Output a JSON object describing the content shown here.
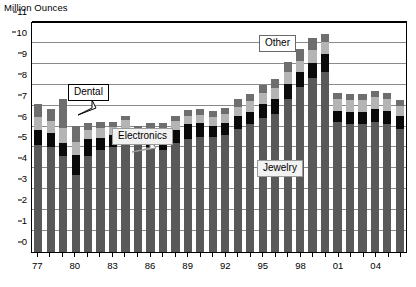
{
  "axis_title": "Million Ounces",
  "labels": {
    "jewelry": "Jewelry",
    "electronics": "Electronics",
    "dental": "Dental",
    "other": "Other"
  },
  "colors": {
    "jewelry": "#595959",
    "electronics": "#0a0a0a",
    "dental": "#b4b4b4",
    "other": "#6e6e6e"
  },
  "chart_data": {
    "type": "bar",
    "stacked": true,
    "title": "",
    "xlabel": "",
    "ylabel": "Million Ounces",
    "ylim": [
      0,
      11
    ],
    "ytick_step": 1,
    "yticks": [
      0,
      1,
      2,
      3,
      4,
      5,
      6,
      7,
      8,
      9,
      10,
      11
    ],
    "grid": true,
    "legend_position": "inline-callouts",
    "categories": [
      "77",
      "78",
      "79",
      "80",
      "81",
      "82",
      "83",
      "84",
      "85",
      "86",
      "87",
      "88",
      "89",
      "90",
      "91",
      "92",
      "93",
      "94",
      "95",
      "96",
      "97",
      "98",
      "99",
      "00",
      "01",
      "02",
      "03",
      "04",
      "05",
      "06"
    ],
    "xtick_labels_shown": [
      "77",
      "80",
      "83",
      "86",
      "89",
      "92",
      "95",
      "98",
      "01",
      "04"
    ],
    "series": [
      {
        "name": "Jewelry",
        "color": "#595959",
        "values": [
          5.1,
          5.0,
          4.6,
          3.7,
          4.6,
          4.9,
          5.0,
          5.3,
          5.2,
          5.0,
          4.9,
          5.2,
          5.4,
          5.5,
          5.5,
          5.6,
          5.9,
          6.1,
          6.4,
          6.6,
          7.3,
          7.9,
          8.3,
          8.6,
          6.2,
          6.1,
          6.1,
          6.2,
          6.1,
          5.9
        ]
      },
      {
        "name": "Electronics",
        "color": "#0a0a0a",
        "values": [
          0.75,
          0.7,
          0.6,
          0.95,
          0.8,
          0.55,
          0.6,
          0.55,
          0.35,
          0.55,
          0.6,
          0.65,
          0.7,
          0.65,
          0.55,
          0.55,
          0.6,
          0.6,
          0.7,
          0.7,
          0.75,
          0.7,
          0.75,
          0.85,
          0.55,
          0.6,
          0.6,
          0.65,
          0.65,
          0.6
        ]
      },
      {
        "name": "Dental",
        "color": "#b4b4b4",
        "values": [
          0.6,
          0.55,
          0.75,
          0.6,
          0.45,
          0.5,
          0.4,
          0.45,
          0.35,
          0.4,
          0.4,
          0.4,
          0.4,
          0.4,
          0.4,
          0.45,
          0.45,
          0.5,
          0.5,
          0.55,
          0.55,
          0.55,
          0.6,
          0.6,
          0.55,
          0.55,
          0.55,
          0.55,
          0.55,
          0.5
        ]
      },
      {
        "name": "Other",
        "color": "#6e6e6e",
        "values": [
          0.65,
          0.6,
          1.35,
          0.8,
          0.3,
          0.25,
          0.2,
          0.2,
          0.15,
          0.2,
          0.25,
          0.25,
          0.3,
          0.3,
          0.3,
          0.3,
          0.35,
          0.35,
          0.4,
          0.45,
          0.5,
          0.55,
          0.6,
          0.4,
          0.3,
          0.3,
          0.3,
          0.3,
          0.3,
          0.25
        ]
      }
    ],
    "totals": [
      7.1,
      6.85,
      7.3,
      6.05,
      6.15,
      6.2,
      6.2,
      6.5,
      6.05,
      6.15,
      6.15,
      6.5,
      6.8,
      6.85,
      6.75,
      6.9,
      7.3,
      7.55,
      8.0,
      8.3,
      9.1,
      9.7,
      10.25,
      10.45,
      7.6,
      7.55,
      7.55,
      7.7,
      7.6,
      7.25
    ]
  }
}
